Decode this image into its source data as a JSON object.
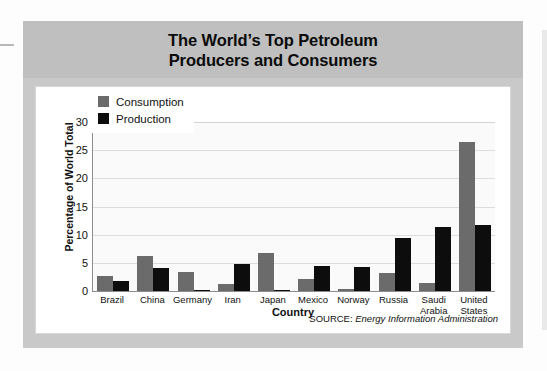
{
  "figure": {
    "title": "The World’s Top Petroleum\nProducers and Consumers",
    "title_line1": "The World’s Top Petroleum",
    "title_line2": "Producers and Consumers",
    "source_label": "SOURCE:",
    "source_value": "Energy Information Administration"
  },
  "colors": {
    "consumption": "#6b6b6b",
    "production": "#0d0d0d",
    "title_band": "#bfbfbf",
    "figure_frame": "#c9c9c9",
    "plot_background": "#fafafa",
    "gridline": "#dddddd",
    "axis": "#8d8d8d"
  },
  "legend": {
    "position": "top-left-inside",
    "entries": [
      {
        "label": "Consumption",
        "color": "#6b6b6b"
      },
      {
        "label": "Production",
        "color": "#0d0d0d"
      }
    ]
  },
  "axes": {
    "y_title": "Percentage of World Total",
    "x_title": "Country",
    "y_ticks": [
      "30",
      "25",
      "20",
      "15",
      "10",
      "5",
      "0"
    ]
  },
  "chart_data": {
    "type": "bar",
    "title": "The World’s Top Petroleum Producers and Consumers",
    "subtitle": "",
    "xlabel": "Country",
    "ylabel": "Percentage of World Total",
    "ylim": [
      0,
      30
    ],
    "ytick_values": [
      0,
      5,
      10,
      15,
      20,
      25,
      30
    ],
    "grid": true,
    "legend_position": "upper left",
    "categories": [
      "Brazil",
      "China",
      "Germany",
      "Iran",
      "Japan",
      "Mexico",
      "Norway",
      "Russia",
      "Saudi Arabia",
      "United States"
    ],
    "category_lines": [
      [
        "Brazil"
      ],
      [
        "China"
      ],
      [
        "Germany"
      ],
      [
        "Iran"
      ],
      [
        "Japan"
      ],
      [
        "Mexico"
      ],
      [
        "Norway"
      ],
      [
        "Russia"
      ],
      [
        "Saudi",
        "Arabia"
      ],
      [
        "United",
        "States"
      ]
    ],
    "series": [
      {
        "name": "Consumption",
        "color": "#6b6b6b",
        "values": [
          2.6,
          6.3,
          3.4,
          1.3,
          6.8,
          2.2,
          0.3,
          3.2,
          1.5,
          26.5
        ]
      },
      {
        "name": "Production",
        "color": "#0d0d0d",
        "values": [
          1.7,
          4.1,
          0.2,
          4.8,
          0.1,
          4.4,
          4.2,
          9.4,
          11.4,
          11.8
        ]
      }
    ],
    "annotations": [
      "SOURCE: Energy Information Administration"
    ]
  }
}
